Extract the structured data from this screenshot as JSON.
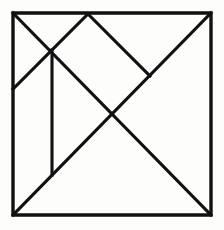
{
  "figure": {
    "kind": "line-diagram",
    "background_color": "#fdfdfc",
    "stroke_color": "#111111",
    "stroke_width": 3.1,
    "canvas": {
      "width": 224,
      "height": 230
    },
    "outline": {
      "name": "outer-square",
      "points": "13,13 211,13 211,215 13,215",
      "closed": true,
      "corners": {
        "top_left": [
          13,
          13
        ],
        "top_right": [
          211,
          13
        ],
        "bottom_right": [
          211,
          215
        ],
        "bottom_left": [
          13,
          215
        ]
      }
    },
    "vertices": {
      "top_left": [
        13,
        13
      ],
      "top_right": [
        211,
        13
      ],
      "bottom_right": [
        211,
        215
      ],
      "bottom_left": [
        13,
        215
      ],
      "top_apex": [
        88,
        14
      ],
      "left_mid": [
        13,
        89
      ],
      "upper_junction": [
        52,
        50
      ],
      "right_notch": [
        150,
        76
      ],
      "center": [
        112,
        114
      ],
      "vertical_bottom": [
        52,
        175
      ]
    },
    "lines": [
      {
        "name": "main-diagonal-upper-left",
        "from": [
          13,
          13
        ],
        "to": [
          112,
          114
        ],
        "description": "diagonal from top-left corner to center"
      },
      {
        "name": "anti-diagonal-full",
        "from": [
          211,
          13
        ],
        "to": [
          13,
          215
        ],
        "description": "diagonal from top-right corner to bottom-left corner"
      },
      {
        "name": "main-diagonal-lower-right",
        "from": [
          112,
          114
        ],
        "to": [
          211,
          215
        ],
        "description": "diagonal from center to bottom-right corner"
      },
      {
        "name": "apex-to-left-edge",
        "from": [
          88,
          14
        ],
        "to": [
          13,
          89
        ],
        "description": "diagonal from top edge apex down-left to left edge"
      },
      {
        "name": "apex-to-right-notch",
        "from": [
          88,
          14
        ],
        "to": [
          150,
          76
        ],
        "description": "diagonal from top edge apex down-right to anti-diagonal"
      },
      {
        "name": "vertical-divider",
        "from": [
          52,
          50
        ],
        "to": [
          52,
          175
        ],
        "description": "vertical segment from upper junction down to anti-diagonal"
      }
    ]
  }
}
